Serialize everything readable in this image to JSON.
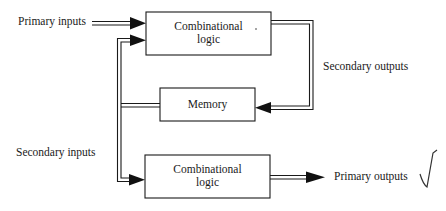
{
  "diagram": {
    "labels": {
      "primary_inputs": "Primary inputs",
      "secondary_outputs": "Secondary outputs",
      "secondary_inputs": "Secondary inputs",
      "primary_outputs": "Primary outputs"
    },
    "blocks": {
      "top_logic": {
        "line1": "Combinational",
        "line2": "logic"
      },
      "memory": {
        "label": "Memory"
      },
      "bottom_logic": {
        "line1": "Combinational",
        "line2": "logic"
      }
    },
    "annotations": {
      "checkmark": "√"
    },
    "colors": {
      "stroke": "#1a1a1a",
      "background": "#ffffff"
    }
  }
}
